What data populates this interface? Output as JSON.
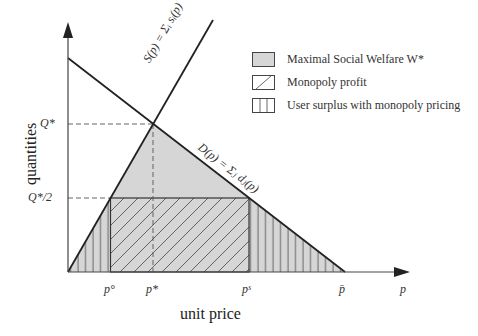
{
  "diagram": {
    "axes": {
      "x_label": "unit price",
      "y_label": "quantities",
      "x_axis_symbol": "p"
    },
    "x_ticks": [
      {
        "id": "p_o",
        "label": "p°"
      },
      {
        "id": "p_star",
        "label": "p*"
      },
      {
        "id": "p_s",
        "label": "pˢ"
      },
      {
        "id": "p_bar",
        "label": "p̄"
      }
    ],
    "y_ticks": [
      {
        "id": "q_star",
        "label": "Q*"
      },
      {
        "id": "q_half",
        "label": "Q*/2"
      }
    ],
    "curves": {
      "supply": "S(p) = Σᵢ sᵢ(p)",
      "demand": "D(p) = Σⱼ dⱼ(p)"
    },
    "legend": [
      {
        "label": "Maximal Social Welfare W*",
        "pattern": "gray-fill"
      },
      {
        "label": "Monopoly profit",
        "pattern": "diagonal-hatch"
      },
      {
        "label": "User surplus with monopoly pricing",
        "pattern": "vertical-hatch"
      }
    ],
    "colors": {
      "fill": "#d6d6d6",
      "line": "#222222",
      "hatch": "#444444"
    }
  }
}
